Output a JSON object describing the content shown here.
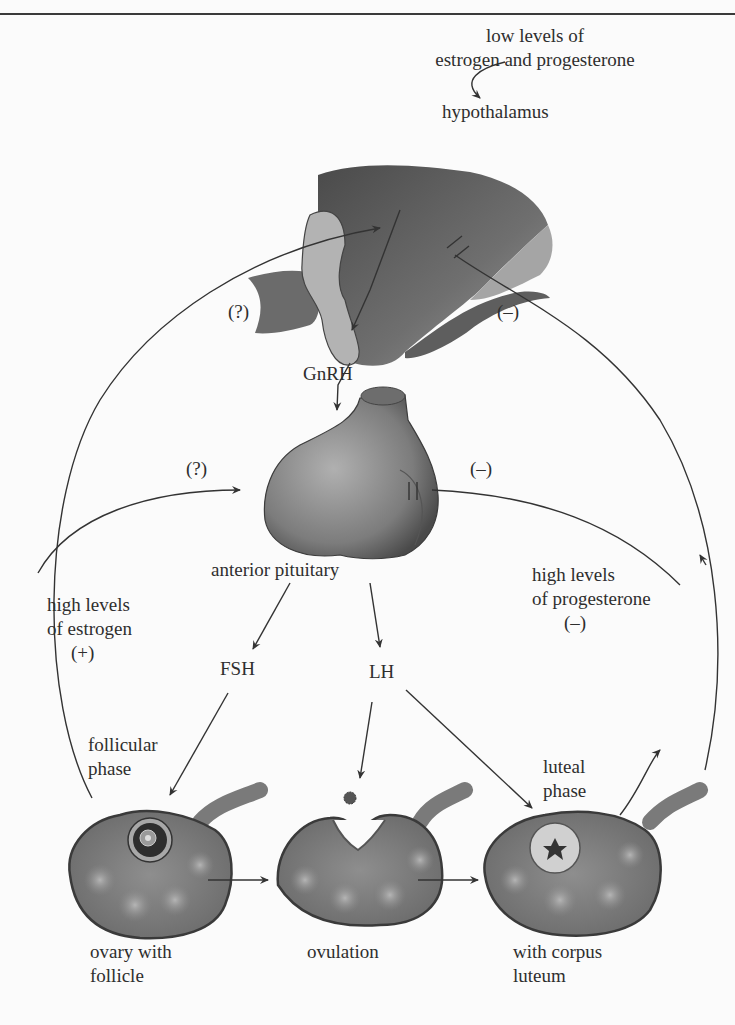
{
  "diagram": {
    "type": "hormonal-feedback-flow",
    "labels": {
      "low_levels_line1": "low levels of",
      "low_levels_line2": "estrogen and progesterone",
      "hypothalamus": "hypothalamus",
      "hypothalamus_q": "(?)",
      "hypothalamus_minus": "(–)",
      "gnrh": "GnRH",
      "pituitary_q": "(?)",
      "pituitary_minus": "(–)",
      "anterior_pituitary": "anterior pituitary",
      "high_estrogen_line1": "high levels",
      "high_estrogen_line2": "of estrogen",
      "high_estrogen_sign": "(+)",
      "high_progesterone_line1": "high levels",
      "high_progesterone_line2": "of progesterone",
      "high_progesterone_sign": "(–)",
      "fsh": "FSH",
      "lh": "LH",
      "follicular_line1": "follicular",
      "follicular_line2": "phase",
      "luteal_line1": "luteal",
      "luteal_line2": "phase",
      "ovary1_line1": "ovary with",
      "ovary1_line2": "follicle",
      "ovary2": "ovulation",
      "ovary3_line1": "with corpus",
      "ovary3_line2": "luteum"
    },
    "nodes": [
      "hypothalamus",
      "anterior pituitary",
      "FSH",
      "LH",
      "ovary with follicle",
      "ovulation",
      "ovary with corpus luteum"
    ],
    "edges": [
      {
        "from": "low levels of estrogen and progesterone",
        "to": "hypothalamus",
        "effect": "stimulate"
      },
      {
        "from": "hypothalamus",
        "to": "anterior pituitary",
        "via": "GnRH"
      },
      {
        "from": "anterior pituitary",
        "to": "FSH"
      },
      {
        "from": "anterior pituitary",
        "to": "LH"
      },
      {
        "from": "FSH",
        "to": "ovary with follicle"
      },
      {
        "from": "LH",
        "to": "ovulation"
      },
      {
        "from": "LH",
        "to": "ovary with corpus luteum"
      },
      {
        "from": "ovary with follicle",
        "to": "hypothalamus",
        "effect": "(?)",
        "via": "high levels of estrogen (+)"
      },
      {
        "from": "ovary with follicle",
        "to": "anterior pituitary",
        "effect": "(?)"
      },
      {
        "from": "ovary with corpus luteum",
        "to": "hypothalamus",
        "effect": "(–) inhibit"
      },
      {
        "from": "ovary with corpus luteum",
        "to": "anterior pituitary",
        "effect": "(–) inhibit",
        "via": "high levels of progesterone (–)"
      }
    ],
    "colors": {
      "background": "#fbfbfb",
      "line": "#333333",
      "tissue_dark": "#5a5a5a",
      "tissue_mid": "#8a8a8a",
      "tissue_light": "#b9b9b9"
    }
  }
}
